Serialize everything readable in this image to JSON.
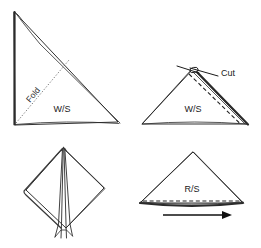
{
  "figure": {
    "type": "instructional-diagram",
    "panel_count": 4,
    "background_color": "#ffffff",
    "line_color": "#1a1a1a"
  },
  "panels": [
    {
      "id": "panel-top-left",
      "position": "top-left",
      "step": 1,
      "shape": "right-triangle",
      "labels": {
        "side": "W/S",
        "fold": "Fold"
      },
      "annotations": [
        {
          "name": "fold-line",
          "style": "dotted",
          "text": "Fold"
        },
        {
          "name": "folded-edge",
          "style": "thick-solid",
          "text": ""
        }
      ]
    },
    {
      "id": "panel-top-right",
      "position": "top-right",
      "step": 2,
      "shape": "triangle",
      "labels": {
        "side": "W/S",
        "cut": "Cut"
      },
      "annotations": [
        {
          "name": "cut-callout",
          "style": "solid-pointer",
          "text": "Cut"
        },
        {
          "name": "stitch-line",
          "style": "dashed",
          "text": ""
        },
        {
          "name": "raw-edge",
          "style": "thick-solid",
          "text": ""
        }
      ]
    },
    {
      "id": "panel-bottom-left",
      "position": "bottom-left",
      "step": 3,
      "shape": "diamond-kite-with-pleats",
      "labels": {},
      "annotations": [
        {
          "name": "center-pleat-lines",
          "style": "solid",
          "text": ""
        }
      ]
    },
    {
      "id": "panel-bottom-right",
      "position": "bottom-right",
      "step": 4,
      "shape": "triangle",
      "labels": {
        "side": "R/S"
      },
      "annotations": [
        {
          "name": "stitch-line",
          "style": "dashed",
          "text": ""
        },
        {
          "name": "direction-arrow",
          "style": "arrow-right",
          "text": ""
        }
      ]
    }
  ],
  "legend_terms": {
    "ws": "W/S",
    "rs": "R/S",
    "fold": "Fold",
    "cut": "Cut"
  }
}
